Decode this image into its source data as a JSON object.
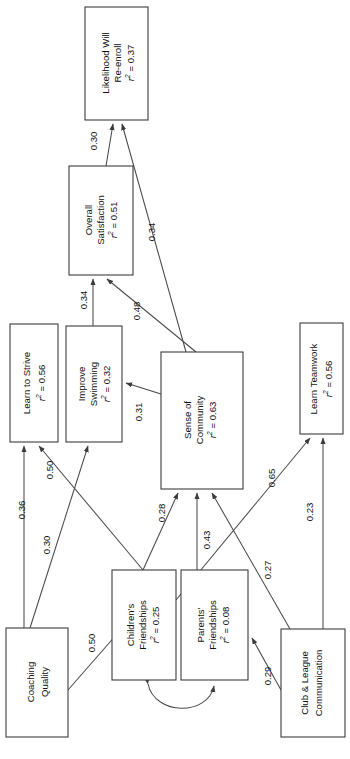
{
  "diagram": {
    "type": "sem-path-diagram",
    "orientation": "rotated-90-ccw",
    "r2_prefix": "r",
    "r2_exponent": "2",
    "r2_equals": " = ",
    "nodes": [
      {
        "id": "likelihood-reenroll",
        "line1": "Likelihood Will",
        "line2": "Re-enroll",
        "r2": "0.37",
        "x": 85,
        "y": 7,
        "w": 63,
        "h": 113
      },
      {
        "id": "overall-satisfaction",
        "line1": "Overall",
        "line2": "Satisfaction",
        "r2": "0.51",
        "x": 69,
        "y": 166,
        "w": 64,
        "h": 109
      },
      {
        "id": "learn-to-strive",
        "line1": "Learn to Strive",
        "line2": "",
        "r2": "0.56",
        "x": 10,
        "y": 324,
        "w": 48,
        "h": 118
      },
      {
        "id": "improve-swimming",
        "line1": "Improve",
        "line2": "Swimming",
        "r2": "0.32",
        "x": 66,
        "y": 326,
        "w": 56,
        "h": 116
      },
      {
        "id": "sense-of-community",
        "line1": "Sense of",
        "line2": "Community",
        "r2": "0.63",
        "x": 161,
        "y": 352,
        "w": 82,
        "h": 137
      },
      {
        "id": "learn-teamwork",
        "line1": "Learn Teamwork",
        "line2": "",
        "r2": "0.56",
        "x": 300,
        "y": 323,
        "w": 43,
        "h": 111
      },
      {
        "id": "childrens-friendships",
        "line1": "Children's",
        "line2": "Friendships",
        "r2": "0.25",
        "x": 112,
        "y": 570,
        "w": 64,
        "h": 110
      },
      {
        "id": "parents-friendships",
        "line1": "Parents'",
        "line2": "Friendships",
        "r2": "0.08",
        "x": 181,
        "y": 570,
        "w": 67,
        "h": 110
      },
      {
        "id": "coaching-quality",
        "line1": "Coaching",
        "line2": "Quality",
        "r2": "",
        "x": 6,
        "y": 628,
        "w": 62,
        "h": 109
      },
      {
        "id": "club-league-communication",
        "line1": "Club & League",
        "line2": "Communication",
        "r2": "",
        "x": 281,
        "y": 629,
        "w": 64,
        "h": 108
      }
    ],
    "paths": [
      {
        "id": "p-satisfaction-to-reenroll",
        "from": "overall-satisfaction",
        "to": "likelihood-reenroll",
        "coef": "0.30",
        "lx": 94,
        "ly": 141
      },
      {
        "id": "p-community-to-reenroll",
        "from": "sense-of-community",
        "to": "likelihood-reenroll",
        "coef": "0.34",
        "lx": 152,
        "ly": 232
      },
      {
        "id": "p-swimming-to-satisfaction",
        "from": "improve-swimming",
        "to": "overall-satisfaction",
        "coef": "0.34",
        "lx": 84,
        "ly": 300
      },
      {
        "id": "p-community-to-satisfaction",
        "from": "sense-of-community",
        "to": "overall-satisfaction",
        "coef": "0.48",
        "lx": 137,
        "ly": 311
      },
      {
        "id": "p-coaching-to-strive",
        "from": "coaching-quality",
        "to": "learn-to-strive",
        "coef": "0.36",
        "lx": 22,
        "ly": 510
      },
      {
        "id": "p-children-to-strive",
        "from": "childrens-friendships",
        "to": "learn-to-strive",
        "coef": "0.50",
        "lx": 50,
        "ly": 470
      },
      {
        "id": "p-coaching-to-swimming",
        "from": "coaching-quality",
        "to": "improve-swimming",
        "coef": "0.30",
        "lx": 47,
        "ly": 545
      },
      {
        "id": "p-community-to-swimming",
        "from": "sense-of-community",
        "to": "improve-swimming",
        "coef": "0.31",
        "lx": 139,
        "ly": 412
      },
      {
        "id": "p-children-to-community",
        "from": "childrens-friendships",
        "to": "sense-of-community",
        "coef": "0.28",
        "lx": 162,
        "ly": 513
      },
      {
        "id": "p-parents-to-community",
        "from": "parents-friendships",
        "to": "sense-of-community",
        "coef": "0.43",
        "lx": 207,
        "ly": 540
      },
      {
        "id": "p-club-to-community",
        "from": "club-league-communication",
        "to": "sense-of-community",
        "coef": "0.27",
        "lx": 268,
        "ly": 570
      },
      {
        "id": "p-children-to-teamwork",
        "from": "childrens-friendships",
        "to": "learn-teamwork",
        "coef": "0.65",
        "lx": 272,
        "ly": 478
      },
      {
        "id": "p-club-to-teamwork",
        "from": "club-league-communication",
        "to": "learn-teamwork",
        "coef": "0.23",
        "lx": 310,
        "ly": 512
      },
      {
        "id": "p-coaching-to-children",
        "from": "coaching-quality",
        "to": "childrens-friendships",
        "coef": "0.50",
        "lx": 92,
        "ly": 643
      },
      {
        "id": "p-club-to-parents",
        "from": "club-league-communication",
        "to": "parents-friendships",
        "coef": "0.29",
        "lx": 268,
        "ly": 676
      }
    ],
    "covariance": {
      "id": "cov-children-parents",
      "from": "childrens-friendships",
      "to": "parents-friendships",
      "coef": ""
    }
  }
}
